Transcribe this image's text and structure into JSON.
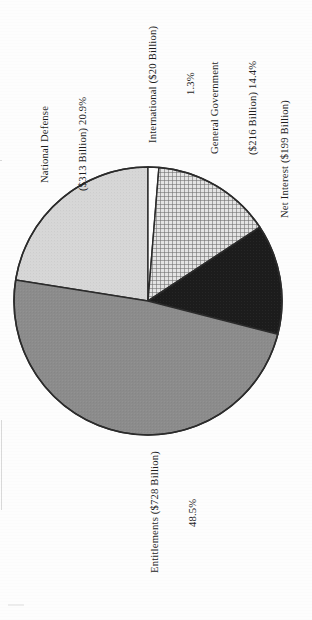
{
  "chart_data": {
    "type": "pie",
    "title": "",
    "subtitle": "",
    "xlabel": "",
    "ylabel": "",
    "legend_position": "none",
    "grid": false,
    "value_unit": "Billion",
    "value_prefix": "$",
    "start_angle_deg": 0,
    "direction": "clockwise",
    "categories": [
      "International",
      "General Government",
      "Net Interest",
      "Entitlements",
      "National Defense"
    ],
    "values": [
      20,
      216,
      199,
      728,
      313
    ],
    "percentages": [
      1.3,
      14.4,
      13.3,
      48.5,
      20.9
    ],
    "slices": [
      {
        "name": "International",
        "amount": 20,
        "amount_text": "$20 Billion",
        "percent": 1.3,
        "percent_text": "1.3%",
        "fill": "#ffffff",
        "pattern": "solid",
        "label_lines": [
          "International ($20 Billion)",
          "1.3%"
        ],
        "start_deg": 0.0,
        "end_deg": 4.68
      },
      {
        "name": "General Government",
        "amount": 216,
        "amount_text": "$216 Billion",
        "percent": 14.4,
        "percent_text": "14.4%",
        "fill": "#c9c9c9",
        "pattern": "crosshatch",
        "label_lines": [
          "General Government",
          "($216 Billion) 14.4%"
        ],
        "start_deg": 4.68,
        "end_deg": 56.52
      },
      {
        "name": "Net Interest",
        "amount": 199,
        "amount_text": "$199 Billion",
        "percent": 13.3,
        "percent_text": "13.3%",
        "fill": "#1c1c1c",
        "pattern": "solid",
        "label_lines": [
          "Net Interest ($199 Billion)",
          "13.3%"
        ],
        "start_deg": 56.52,
        "end_deg": 104.4
      },
      {
        "name": "Entitlements",
        "amount": 728,
        "amount_text": "$728 Billion",
        "percent": 48.5,
        "percent_text": "48.5%",
        "fill": "#8c8c8c",
        "pattern": "solid",
        "label_lines": [
          "Entitlements ($728 Billion)",
          "48.5%"
        ],
        "start_deg": 104.4,
        "end_deg": 279.0
      },
      {
        "name": "National Defense",
        "amount": 313,
        "amount_text": "$313 Billion",
        "percent": 20.9,
        "percent_text": "20.9%",
        "fill": "#d7d7d7",
        "pattern": "solid",
        "label_lines": [
          "National Defense",
          "($313 Billion) 20.9%"
        ],
        "start_deg": 279.0,
        "end_deg": 360.0
      }
    ]
  },
  "labels": {
    "national_defense": {
      "line1": "National Defense",
      "line2": "($313 Billion) 20.9%"
    },
    "international": {
      "line1": "International ($20 Billion)",
      "line2": "1.3%"
    },
    "general_government": {
      "line1": "General Government",
      "line2": "($216 Billion) 14.4%"
    },
    "net_interest": {
      "line1": "Net Interest ($199 Billion)",
      "line2": "13.3%"
    },
    "entitlements": {
      "line1": "Entitlements ($728 Billion)",
      "line2": "48.5%"
    }
  },
  "colors": {
    "outline": "#2b2b2b",
    "national_defense": "#d7d7d7",
    "entitlements": "#8c8c8c",
    "net_interest": "#1c1c1c",
    "general_government": "#c9c9c9",
    "international": "#ffffff",
    "page_background": "#fdfdfd"
  },
  "geometry": {
    "center_x": 148,
    "center_y": 301,
    "radius": 134
  }
}
